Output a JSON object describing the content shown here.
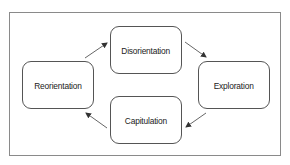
{
  "diagram": {
    "type": "cycle",
    "nodes": [
      {
        "id": "disorientation",
        "label": "Disorientation"
      },
      {
        "id": "exploration",
        "label": "Exploration"
      },
      {
        "id": "capitulation",
        "label": "Capitulation"
      },
      {
        "id": "reorientation",
        "label": "Reorientation"
      }
    ],
    "edges": [
      {
        "from": "reorientation",
        "to": "disorientation"
      },
      {
        "from": "disorientation",
        "to": "exploration"
      },
      {
        "from": "exploration",
        "to": "capitulation"
      },
      {
        "from": "capitulation",
        "to": "reorientation"
      }
    ],
    "colors": {
      "frame": "#8a8a8a",
      "node_border": "#555555",
      "arrow": "#333333",
      "text": "#222222"
    }
  }
}
